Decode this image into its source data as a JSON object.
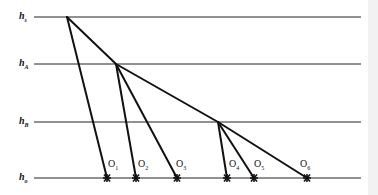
{
  "diagram": {
    "type": "tree-hierarchy-levels",
    "levels": [
      {
        "id": "h_s",
        "base": "h",
        "sub": "s",
        "y": 17
      },
      {
        "id": "h_A",
        "base": "h",
        "sub": "A",
        "y": 64
      },
      {
        "id": "h_B",
        "base": "h",
        "sub": "B",
        "y": 122
      },
      {
        "id": "h_o",
        "base": "h",
        "sub": "o",
        "y": 178
      }
    ],
    "nodes": [
      {
        "id": "S",
        "x": 67,
        "y": 17
      },
      {
        "id": "A",
        "x": 116,
        "y": 64
      },
      {
        "id": "B",
        "x": 218,
        "y": 122
      }
    ],
    "observations": [
      {
        "base": "O",
        "sub": "1",
        "x": 107
      },
      {
        "base": "O",
        "sub": "2",
        "x": 136
      },
      {
        "base": "O",
        "sub": "3",
        "x": 177
      },
      {
        "base": "O",
        "sub": "4",
        "x": 227
      },
      {
        "base": "O",
        "sub": "5",
        "x": 254
      },
      {
        "base": "O",
        "sub": "6",
        "x": 307
      }
    ],
    "edges": [
      [
        "S",
        "O1"
      ],
      [
        "S",
        "A"
      ],
      [
        "A",
        "O2"
      ],
      [
        "A",
        "O3"
      ],
      [
        "A",
        "B"
      ],
      [
        "B",
        "O4"
      ],
      [
        "B",
        "O5"
      ],
      [
        "B",
        "O6"
      ]
    ],
    "colors": {
      "line": "#111111",
      "background": "#ffffff"
    }
  }
}
